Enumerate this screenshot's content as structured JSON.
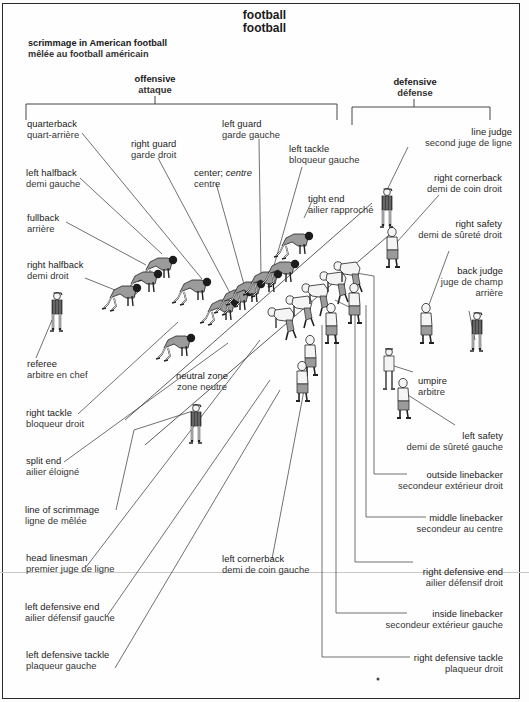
{
  "title": {
    "en": "football",
    "fr": "football"
  },
  "subtitle": {
    "en": "scrimmage in American football",
    "fr": "mêlée au football américain"
  },
  "groups": {
    "offensive": {
      "en": "offensive",
      "fr": "attaque"
    },
    "defensive": {
      "en": "defensive",
      "fr": "défense"
    }
  },
  "labels": {
    "quarterback": {
      "en": "quarterback",
      "fr": "quart-arrière"
    },
    "right_guard": {
      "en": "right guard",
      "fr": "garde droit"
    },
    "left_guard": {
      "en": "left guard",
      "fr": "garde gauche"
    },
    "left_tackle": {
      "en": "left tackle",
      "fr": "bloqueur gauche"
    },
    "left_halfback": {
      "en": "left halfback",
      "fr": "demi gauche"
    },
    "center": {
      "en": "center;",
      "en_alt": "centre",
      "fr": "centre"
    },
    "tight_end": {
      "en": "tight end",
      "fr": "ailier rapproché"
    },
    "fullback": {
      "en": "fullback",
      "fr": "arrière"
    },
    "right_halfback": {
      "en": "right halfback",
      "fr": "demi droit"
    },
    "line_judge": {
      "en": "line judge",
      "fr": "second juge de ligne"
    },
    "right_cornerback": {
      "en": "right cornerback",
      "fr": "demi de coin droit"
    },
    "right_safety": {
      "en": "right safety",
      "fr": "demi de sûreté droit"
    },
    "back_judge": {
      "en": "back judge",
      "fr": "juge de champ",
      "fr2": "arrière"
    },
    "referee": {
      "en": "referee",
      "fr": "arbitre en chef"
    },
    "neutral_zone": {
      "en": "neutral zone",
      "fr": "zone neutre"
    },
    "umpire": {
      "en": "umpire",
      "fr": "arbitre"
    },
    "right_tackle": {
      "en": "right tackle",
      "fr": "bloqueur droit"
    },
    "left_safety": {
      "en": "left safety",
      "fr": "demi de sûreté gauche"
    },
    "split_end": {
      "en": "split end",
      "fr": "ailier éloigné"
    },
    "outside_linebacker": {
      "en": "outside linebacker",
      "fr": "secondeur extérieur droit"
    },
    "line_of_scrimmage": {
      "en": "line of scrimmage",
      "fr": "ligne de mêlée"
    },
    "middle_linebacker": {
      "en": "middle linebacker",
      "fr": "secondeur au centre"
    },
    "head_linesman": {
      "en": "head linesman",
      "fr": "premier juge de ligne"
    },
    "left_cornerback": {
      "en": "left cornerback",
      "fr": "demi de coin gauche"
    },
    "right_defensive_end": {
      "en": "right defensive end",
      "fr": "ailier défensif droit"
    },
    "left_defensive_end": {
      "en": "left defensive end",
      "fr": "ailier défensif gauche"
    },
    "inside_linebacker": {
      "en": "inside linebacker",
      "fr": "secondeur extérieur gauche"
    },
    "left_defensive_tackle": {
      "en": "left defensive tackle",
      "fr": "plaqueur gauche"
    },
    "right_defensive_tackle": {
      "en": "right defensive tackle",
      "fr": "plaqueur droit"
    }
  },
  "colors": {
    "ink": "#1a1a1a",
    "jersey_offense": "#9a9a9a",
    "jersey_defense": "#f4f4f4",
    "frame": "#2a2a2a"
  }
}
